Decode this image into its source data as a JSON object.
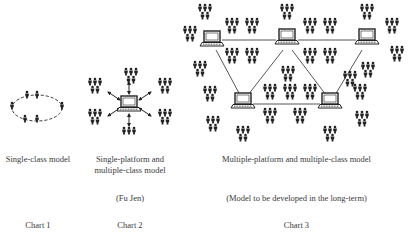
{
  "charts": [
    {
      "id": "chart1",
      "title": "Single-class model",
      "note": "",
      "label": "Chart 1"
    },
    {
      "id": "chart2",
      "title": "Single-platform and multiple-class model",
      "title_line1": "Single-platform and",
      "title_line2": "multiple-class model",
      "note": "(Fu Jen)",
      "label": "Chart 2"
    },
    {
      "id": "chart3",
      "title": "Multiple-platform and multiple-class model",
      "note": "(Model to be developed in the long-term)",
      "label": "Chart 3"
    }
  ],
  "icons": {
    "person": "person-icon",
    "computer": "laptop-icon",
    "arrow": "double-arrow"
  },
  "colors": {
    "ink": "#222222",
    "text": "#3a3a3a",
    "background": "#ffffff"
  }
}
